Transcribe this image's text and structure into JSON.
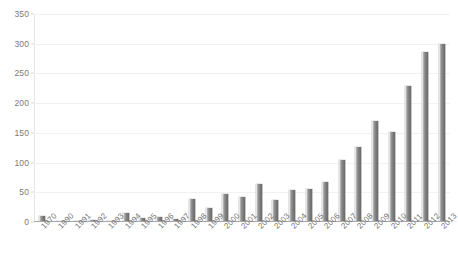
{
  "chart_data": {
    "type": "bar",
    "title": "",
    "subtitle": "",
    "xlabel": "",
    "ylabel": "",
    "ylim": [
      0,
      350
    ],
    "ytick_step": 50,
    "yticks": [
      0,
      50,
      100,
      150,
      200,
      250,
      300,
      350
    ],
    "grid": true,
    "legend": false,
    "legend_position": "none",
    "bar_color": "#8a8a8a",
    "gridline_color": "#f2f2f2",
    "axis_color": "#a9a9a9",
    "categories": [
      "1970",
      "1990",
      "1991",
      "1992",
      "1993",
      "1994",
      "1995",
      "1996",
      "1997",
      "1998",
      "1999",
      "2000",
      "2001",
      "2002",
      "2003",
      "2004",
      "2005",
      "2006",
      "2007",
      "2008",
      "2009",
      "2010",
      "2011",
      "2012",
      "2013"
    ],
    "values": [
      11,
      3,
      4,
      5,
      3,
      17,
      9,
      10,
      7,
      41,
      25,
      48,
      44,
      65,
      38,
      55,
      57,
      69,
      106,
      128,
      172,
      153,
      230,
      288,
      302
    ],
    "series": [
      {
        "name": "",
        "values": [
          11,
          3,
          4,
          5,
          3,
          17,
          9,
          10,
          7,
          41,
          25,
          48,
          44,
          65,
          38,
          55,
          57,
          69,
          106,
          128,
          172,
          153,
          230,
          288,
          302
        ]
      }
    ]
  }
}
